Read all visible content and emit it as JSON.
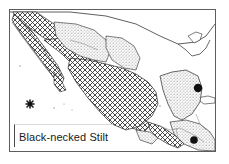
{
  "figure": {
    "kind": "species-range-map",
    "caption": "Black-necked Stilt",
    "region_depicted": "Mexico and Central America",
    "frame": {
      "visible": true,
      "color": "#5d5d5d"
    },
    "background_color": "#ffffff",
    "ink_color": "#1a1a1a"
  },
  "legend_patterns": [
    {
      "id": "core-range",
      "name": "cross-hatch-fill",
      "description": "dense diagonal cross-hatching",
      "color": "#2b2b2b"
    },
    {
      "id": "secondary-range",
      "name": "stipple-fill",
      "description": "fine dot stipple",
      "color": "#6f6f6f"
    }
  ],
  "point_markers": [
    {
      "id": "dot-yucatan-east",
      "symbol": "filled-circle",
      "x": 197,
      "y": 94,
      "r": 4.2
    },
    {
      "id": "dot-central-america",
      "symbol": "filled-circle",
      "x": 193,
      "y": 144,
      "r": 4.0
    },
    {
      "id": "star-pacific-island",
      "symbol": "asterisk",
      "x": 29,
      "y": 112,
      "size": 8
    }
  ],
  "map_geometry": {
    "coastline_color": "#2a2a2a",
    "border_color": "#7a7a7a",
    "mainland_path": "M 12 2 L 12 30 L 30 44 L 44 56 L 58 70 L 70 84 L 84 100 L 96 114 L 112 128 L 126 136 L 140 136 L 152 130 L 160 120 L 168 112 L 176 104 L 186 96 L 196 92 L 200 84 L 198 70 L 188 62 L 174 58 L 158 56 L 146 54 L 138 48 L 134 38 L 130 26 L 126 14 L 120 4 L 100 2 Z",
    "baja_path": "M 14 6 L 26 18 L 38 34 L 50 50 L 58 62 L 62 72 L 58 76 L 50 68 L 40 54 L 28 38 L 16 22 L 10 12 Z",
    "yucatan_path": "M 150 66 L 160 62 L 176 60 L 190 64 L 196 76 L 194 90 L 188 104 L 178 112 L 168 112 L 160 104 L 156 92 L 152 78 Z"
  }
}
